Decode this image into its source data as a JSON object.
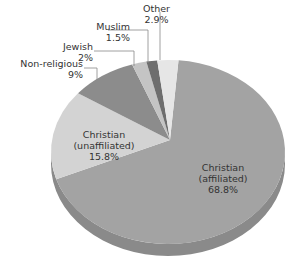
{
  "chart_data": {
    "type": "pie",
    "style": "3d",
    "title": "",
    "categories": [
      "Christian (affiliated)",
      "Christian (unaffiliated)",
      "Non-religious",
      "Jewish",
      "Muslim",
      "Other"
    ],
    "values": [
      68.8,
      15.8,
      9,
      2,
      1.5,
      2.9
    ],
    "value_labels": [
      "68.8%",
      "15.8%",
      "9%",
      "2%",
      "1.5%",
      "2.9%"
    ],
    "colors": [
      "#a3a3a3",
      "#d3d3d3",
      "#8c8c8c",
      "#c4c4c4",
      "#6e6e6e",
      "#e6e6e6"
    ],
    "legend": "none",
    "labels_position": "callouts and inside"
  },
  "labels": {
    "other": {
      "name": "Other",
      "value": "2.9%"
    },
    "muslim": {
      "name": "Muslim",
      "value": "1.5%"
    },
    "jewish": {
      "name": "Jewish",
      "value": "2%"
    },
    "nonreligious": {
      "name": "Non-religious",
      "value": "9%"
    },
    "unaffiliated": {
      "name1": "Christian",
      "name2": "(unaffiliated)",
      "value": "15.8%"
    },
    "affiliated": {
      "name1": "Christian",
      "name2": "(affiliated)",
      "value": "68.8%"
    }
  }
}
